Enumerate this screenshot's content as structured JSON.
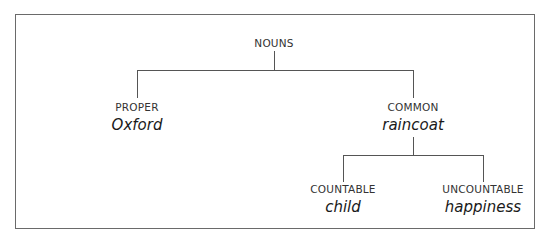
{
  "diagram": {
    "type": "tree",
    "root": {
      "label": "NOUNS"
    },
    "level1": [
      {
        "label": "PROPER",
        "example": "Oxford"
      },
      {
        "label": "COMMON",
        "example": "raincoat"
      }
    ],
    "level2": [
      {
        "parent": "COMMON",
        "label": "COUNTABLE",
        "example": "child"
      },
      {
        "parent": "COMMON",
        "label": "UNCOUNTABLE",
        "example": "happiness"
      }
    ],
    "edges": [
      [
        "NOUNS",
        "PROPER"
      ],
      [
        "NOUNS",
        "COMMON"
      ],
      [
        "COMMON",
        "COUNTABLE"
      ],
      [
        "COMMON",
        "UNCOUNTABLE"
      ]
    ],
    "line_color": "#555555",
    "border_color": "#6a6a6a"
  }
}
